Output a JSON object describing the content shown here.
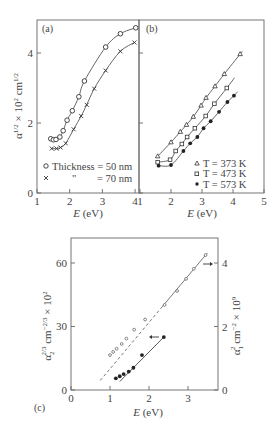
{
  "chart_data": [
    {
      "panel": "(a)",
      "type": "scatter",
      "xlabel": "E (eV)",
      "ylabel": "α^{1/2} × 10^2 cm^{1/2}",
      "xlim": [
        1,
        4.1
      ],
      "ylim": [
        0,
        4.94
      ],
      "xticks": [
        "1",
        "2",
        "3",
        "4"
      ],
      "yticks": [
        "0",
        "2",
        "4"
      ],
      "grid": false,
      "legend_position": "lower right",
      "series": [
        {
          "name": "Thickness = 50 nm",
          "marker": "circle-open",
          "x": [
            1.42,
            1.5,
            1.58,
            1.7,
            1.8,
            1.92,
            2.08,
            2.28,
            2.45,
            3.1,
            3.55,
            4.02
          ],
          "y": [
            1.55,
            1.52,
            1.53,
            1.6,
            1.78,
            2.08,
            2.35,
            2.75,
            3.2,
            4.17,
            4.55,
            4.72
          ]
        },
        {
          "name": "\" = 70 nm",
          "marker": "x",
          "x": [
            1.45,
            1.6,
            1.72,
            1.88,
            2.12,
            2.35,
            2.52,
            2.75,
            3.1,
            3.55,
            3.98
          ],
          "y": [
            1.27,
            1.27,
            1.3,
            1.42,
            1.82,
            2.2,
            2.52,
            2.98,
            3.5,
            4.05,
            4.3
          ]
        }
      ]
    },
    {
      "panel": "(b)",
      "type": "scatter",
      "xlabel": "E (eV)",
      "ylabel": "",
      "xlim": [
        1,
        5
      ],
      "ylim": [
        0,
        4.94
      ],
      "xticks": [
        "1",
        "2",
        "3",
        "4",
        "5"
      ],
      "yticks": [
        "",
        "",
        ""
      ],
      "grid": false,
      "legend_position": "lower right",
      "series": [
        {
          "name": "T = 373 K",
          "marker": "triangle-open",
          "x": [
            1.57,
            2.0,
            2.3,
            2.5,
            2.72,
            2.97,
            3.13,
            3.42,
            3.72,
            4.23
          ],
          "y": [
            1.05,
            1.45,
            1.75,
            1.95,
            2.18,
            2.5,
            2.72,
            3.05,
            3.4,
            3.97
          ]
        },
        {
          "name": "T = 473 K",
          "marker": "square-open",
          "x": [
            1.57,
            1.97,
            2.15,
            2.35,
            2.52,
            2.77,
            3.12,
            3.4,
            3.8
          ],
          "y": [
            0.88,
            0.95,
            1.2,
            1.4,
            1.6,
            1.85,
            2.2,
            2.55,
            3.0
          ]
        },
        {
          "name": "T = 573 K",
          "marker": "circle-filled",
          "x": [
            1.6,
            2.0,
            2.4,
            2.62,
            2.85,
            3.05,
            3.28,
            3.55,
            3.82,
            4.03
          ],
          "y": [
            0.78,
            0.8,
            1.2,
            1.42,
            1.6,
            1.85,
            2.05,
            2.32,
            2.6,
            2.78
          ]
        }
      ]
    },
    {
      "panel": "(c)",
      "type": "scatter",
      "xlabel": "E (eV)",
      "ylabel": "α_2^{2/3} cm^{-2/3} × 10^2",
      "ylabel_right": "α_1^2 cm^{-2} × 10^9",
      "xlim": [
        0,
        3.77
      ],
      "ylim": [
        0,
        71.8
      ],
      "ylim_right": [
        0,
        4.79
      ],
      "xticks": [
        "0",
        "1",
        "2",
        "3"
      ],
      "yticks": [
        "0",
        "30",
        "60"
      ],
      "yticks_right": [
        "0",
        "2",
        "4"
      ],
      "grid": false,
      "series": [
        {
          "name": "α_1^2 (right axis)",
          "marker": "circle-open-small",
          "axis": "right",
          "x": [
            1.0,
            1.08,
            1.17,
            1.3,
            1.42,
            1.62,
            1.9,
            2.4,
            2.72,
            2.95,
            3.15,
            3.45
          ],
          "y": [
            1.1,
            1.2,
            1.3,
            1.45,
            1.62,
            1.9,
            2.22,
            2.68,
            3.12,
            3.5,
            3.82,
            4.25
          ],
          "fit": {
            "x": [
              0.75,
              3.5
            ],
            "y": [
              0.3,
              4.32
            ],
            "style": "dashed-then-solid"
          }
        },
        {
          "name": "α_2^{2/3} (left axis)",
          "marker": "circle-filled",
          "axis": "left",
          "x": [
            1.15,
            1.25,
            1.35,
            1.48,
            1.6,
            1.82,
            2.38
          ],
          "y": [
            5.5,
            6.5,
            7.5,
            8.7,
            10.5,
            16.5,
            25.0
          ],
          "fit": {
            "x": [
              1.25,
              2.38
            ],
            "y": [
              4.0,
              25.0
            ],
            "style": "solid"
          }
        }
      ],
      "annotations": [
        {
          "type": "arrow",
          "direction": "right",
          "near": [
            3.55,
            60
          ],
          "meaning": "points to right axis"
        },
        {
          "type": "arrow",
          "direction": "left",
          "near": [
            2.05,
            24
          ],
          "meaning": "points to left axis"
        }
      ]
    }
  ],
  "panels": {
    "a": {
      "tag": "(a)",
      "xlabel_italic": "E",
      "xlabel_unit": " (eV)",
      "xticks": [
        "1",
        "2",
        "3",
        "4"
      ],
      "yticks": [
        "0",
        "2",
        "4"
      ],
      "ylabel": "α",
      "ylabel_sup1": "1/2",
      "ylabel_mid": " × 10",
      "ylabel_sup2": "2",
      "ylabel_unit": " cm",
      "ylabel_sup3": "1/2",
      "legend": [
        {
          "marker": "circle-open",
          "label": "Thickness = 50 nm"
        },
        {
          "marker": "x",
          "label": "\"            = 70 nm",
          "ditto": "\"",
          "rest": "= 70 nm"
        }
      ]
    },
    "b": {
      "tag": "(b)",
      "xlabel_italic": "E",
      "xlabel_unit": " (eV)",
      "xticks": [
        "1",
        "2",
        "3",
        "4",
        "5"
      ],
      "legend": [
        {
          "marker": "triangle-open",
          "label": "T = 373 K"
        },
        {
          "marker": "square-open",
          "label": "T = 473 K"
        },
        {
          "marker": "circle-filled",
          "label": "T = 573 K"
        }
      ]
    },
    "c": {
      "tag": "(c)",
      "xlabel_italic": "E",
      "xlabel_unit": " (eV)",
      "xticks": [
        "0",
        "1",
        "2",
        "3"
      ],
      "yticks_left": [
        "0",
        "30",
        "60"
      ],
      "yticks_right": [
        "0",
        "2",
        "4"
      ],
      "ylabel_left": {
        "base": "α",
        "sub": "2",
        "sup": "2/3",
        "rest": " cm",
        "sup2": "−2/3",
        "tail": " × 10",
        "sup3": "2"
      },
      "ylabel_right": {
        "base": "α",
        "sub": "1",
        "sup": "2",
        "rest": " cm",
        "sup2": "−2",
        "tail": " × 10",
        "sup3": "9"
      }
    }
  },
  "colors": {
    "axis": "#666666",
    "text": "#444444",
    "marker": "#333333",
    "background": "#ffffff"
  }
}
